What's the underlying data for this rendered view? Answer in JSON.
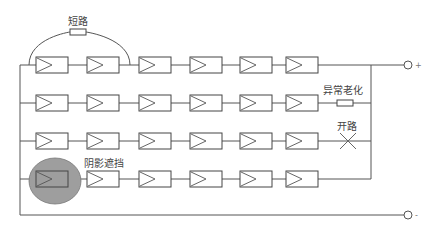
{
  "diagram": {
    "labels": {
      "short_circuit": "短路",
      "abnormal_aging": "异常老化",
      "open_circuit": "开路",
      "shading": "阴影遮挡"
    },
    "terminals": {
      "positive": "+",
      "negative": "-"
    },
    "rows": [
      {
        "modules": 6,
        "fault": "short_circuit"
      },
      {
        "modules": 6,
        "fault": "abnormal_aging"
      },
      {
        "modules": 6,
        "fault": "open_circuit"
      },
      {
        "modules": 6,
        "fault": "shading"
      }
    ],
    "colors": {
      "line": "#555555",
      "shade": "#9e9e9e"
    }
  }
}
